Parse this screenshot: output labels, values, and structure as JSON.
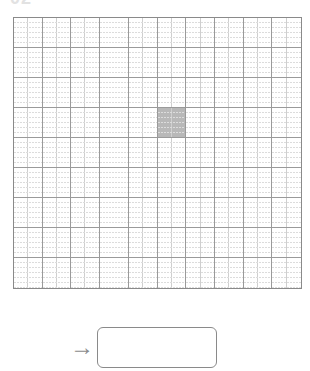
{
  "page": {
    "label": "02"
  },
  "grid": {
    "columns": 10,
    "rows": 9,
    "shaded_cells": [
      {
        "row": 3,
        "col": 5
      }
    ],
    "colors": {
      "major_line": "#9a9a9a",
      "minor_line": "#cfcfcf",
      "shaded": "#b8b8b8"
    }
  },
  "answer": {
    "arrow_icon": "→",
    "value": ""
  }
}
